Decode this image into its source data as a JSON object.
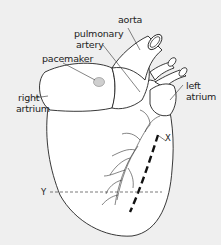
{
  "diagram": {
    "background": "#efefef",
    "line_color": "#222222",
    "labels": {
      "aorta": "aorta",
      "pulmonary_artery_line1": "pulmonary",
      "pulmonary_artery_line2": "artery",
      "pacemaker": "pacemaker",
      "right_atrium_line1": "right",
      "right_atrium_line2": "artrium",
      "left_atrium_line1": "left",
      "left_atrium_line2": "atrium",
      "x_marker": "X",
      "y_marker": "Y"
    }
  }
}
